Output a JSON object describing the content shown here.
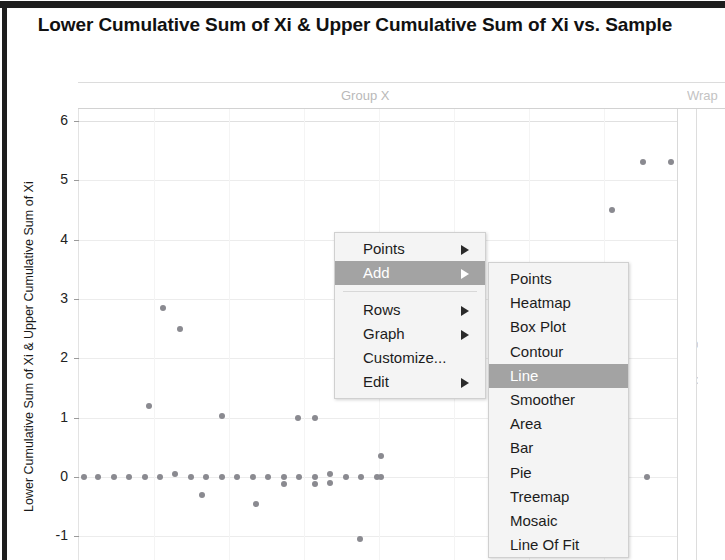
{
  "window": {
    "title": "Lower Cumulative Sum of Xi & Upper Cumulative Sum of Xi vs. Sample"
  },
  "panels": {
    "group_x_label": "Group X",
    "wrap_label": "Wrap",
    "group_y_label": "Group Y"
  },
  "axes": {
    "y_title": "Lower Cumulative Sum of Xi & Upper Cumulative Sum of Xi",
    "y_ticks": [
      "6",
      "5",
      "4",
      "3",
      "2",
      "1",
      "0",
      "-1"
    ]
  },
  "context_menu": {
    "items": [
      {
        "label": "Points",
        "submenu": true,
        "selected": false,
        "separator_after": false
      },
      {
        "label": "Add",
        "submenu": true,
        "selected": true,
        "separator_after": true
      },
      {
        "label": "Rows",
        "submenu": true,
        "selected": false,
        "separator_after": false
      },
      {
        "label": "Graph",
        "submenu": true,
        "selected": false,
        "separator_after": false
      },
      {
        "label": "Customize...",
        "submenu": false,
        "selected": false,
        "separator_after": false
      },
      {
        "label": "Edit",
        "submenu": true,
        "selected": false,
        "separator_after": false
      }
    ]
  },
  "add_submenu": {
    "items": [
      {
        "label": "Points",
        "selected": false
      },
      {
        "label": "Heatmap",
        "selected": false
      },
      {
        "label": "Box Plot",
        "selected": false
      },
      {
        "label": "Contour",
        "selected": false
      },
      {
        "label": "Line",
        "selected": true
      },
      {
        "label": "Smoother",
        "selected": false
      },
      {
        "label": "Area",
        "selected": false
      },
      {
        "label": "Bar",
        "selected": false
      },
      {
        "label": "Pie",
        "selected": false
      },
      {
        "label": "Treemap",
        "selected": false
      },
      {
        "label": "Mosaic",
        "selected": false
      },
      {
        "label": "Line Of Fit",
        "selected": false
      }
    ]
  },
  "colors": {
    "point": "#8a8a90",
    "menu_highlight": "#a3a3a3",
    "menu_bg": "#f4f4f4",
    "grid": "#ececec"
  },
  "chart_data": {
    "type": "scatter",
    "title": "Lower Cumulative Sum of Xi & Upper Cumulative Sum of Xi vs. Sample",
    "xlabel": "Sample",
    "ylabel": "Lower Cumulative Sum of Xi & Upper Cumulative Sum of Xi",
    "ylim": [
      -1.4,
      6.2
    ],
    "xlim": [
      0,
      40
    ],
    "yticks": [
      -1,
      0,
      1,
      2,
      3,
      4,
      5,
      6
    ],
    "grid": true,
    "legend": null,
    "series": [
      {
        "name": "Cumulative Sum",
        "points": [
          {
            "x": 0.4,
            "y": 0.0
          },
          {
            "x": 1.3,
            "y": 0.0
          },
          {
            "x": 2.3,
            "y": 0.0
          },
          {
            "x": 3.3,
            "y": 0.0
          },
          {
            "x": 4.3,
            "y": 0.0
          },
          {
            "x": 5.3,
            "y": 0.0
          },
          {
            "x": 6.3,
            "y": 0.05
          },
          {
            "x": 7.3,
            "y": 0.0
          },
          {
            "x": 8.3,
            "y": 0.0
          },
          {
            "x": 9.3,
            "y": 0.0
          },
          {
            "x": 10.3,
            "y": 0.0
          },
          {
            "x": 11.3,
            "y": 0.0
          },
          {
            "x": 12.3,
            "y": 0.0
          },
          {
            "x": 13.3,
            "y": 0.0
          },
          {
            "x": 13.3,
            "y": -0.12
          },
          {
            "x": 14.3,
            "y": 0.0
          },
          {
            "x": 15.3,
            "y": 0.0
          },
          {
            "x": 15.3,
            "y": -0.12
          },
          {
            "x": 16.3,
            "y": 0.05
          },
          {
            "x": 16.3,
            "y": -0.1
          },
          {
            "x": 17.3,
            "y": 0.0
          },
          {
            "x": 18.3,
            "y": 0.0
          },
          {
            "x": 19.3,
            "y": 0.0
          },
          {
            "x": 19.6,
            "y": 0.0
          },
          {
            "x": 5.5,
            "y": 2.85
          },
          {
            "x": 6.6,
            "y": 2.5
          },
          {
            "x": 4.6,
            "y": 1.2
          },
          {
            "x": 9.3,
            "y": 1.02
          },
          {
            "x": 14.2,
            "y": 1.0
          },
          {
            "x": 15.3,
            "y": 1.0
          },
          {
            "x": 8.0,
            "y": -0.3
          },
          {
            "x": 11.5,
            "y": -0.45
          },
          {
            "x": 19.6,
            "y": 0.35
          },
          {
            "x": 18.2,
            "y": -1.05
          },
          {
            "x": 36.5,
            "y": 5.3
          },
          {
            "x": 38.3,
            "y": 5.3
          },
          {
            "x": 34.5,
            "y": 4.5
          },
          {
            "x": 34.8,
            "y": 0.0
          },
          {
            "x": 36.8,
            "y": 0.0
          }
        ]
      }
    ]
  }
}
